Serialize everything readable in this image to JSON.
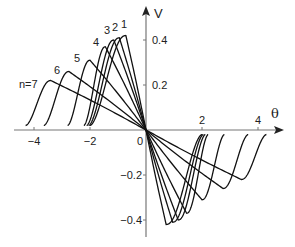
{
  "chart_data": {
    "type": "line",
    "title": "",
    "xlabel": "θ",
    "ylabel": "V",
    "xlim": [
      -4.5,
      4.9
    ],
    "ylim": [
      -0.45,
      0.5
    ],
    "grid": false,
    "legend_position": "inline curve labels",
    "x_ticks": [
      -4,
      -2,
      0,
      2,
      4
    ],
    "x_tick_labels": [
      "−4",
      "−2",
      "0",
      "2",
      "4"
    ],
    "y_ticks": [
      0.4,
      0.2,
      -0.2,
      -0.4
    ],
    "y_tick_labels": [
      "0.4",
      "0.2",
      "−0.2",
      "−0.4"
    ],
    "symmetry": "odd (V(−θ) = −V(θ))",
    "series": [
      {
        "name": "1",
        "label": "1",
        "start_theta": -2.0,
        "peak_theta": -0.72,
        "peak_V": 0.42
      },
      {
        "name": "2",
        "label": "2",
        "start_theta": -2.05,
        "peak_theta": -0.95,
        "peak_V": 0.41
      },
      {
        "name": "3",
        "label": "3",
        "start_theta": -2.12,
        "peak_theta": -1.15,
        "peak_V": 0.4
      },
      {
        "name": "4",
        "label": "4",
        "start_theta": -2.22,
        "peak_theta": -1.45,
        "peak_V": 0.37
      },
      {
        "name": "5",
        "label": "5",
        "start_theta": -2.8,
        "peak_theta": -2.0,
        "peak_V": 0.31
      },
      {
        "name": "6",
        "label": "6",
        "start_theta": -3.65,
        "peak_theta": -2.75,
        "peak_V": 0.26
      },
      {
        "name": "7",
        "label": "n=7",
        "start_theta": -4.3,
        "peak_theta": -3.4,
        "peak_V": 0.22
      }
    ],
    "label_positions_px": [
      {
        "text": "1",
        "x": 121,
        "y": 28
      },
      {
        "text": "2",
        "x": 112,
        "y": 31
      },
      {
        "text": "3",
        "x": 104,
        "y": 34
      },
      {
        "text": "4",
        "x": 93,
        "y": 46
      },
      {
        "text": "5",
        "x": 74,
        "y": 62
      },
      {
        "text": "6",
        "x": 54,
        "y": 74
      },
      {
        "text": "n=7",
        "x": 19,
        "y": 88
      }
    ]
  },
  "axes": {
    "x_label": "θ",
    "y_label": "V"
  }
}
